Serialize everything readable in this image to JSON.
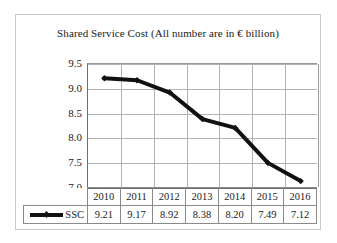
{
  "chart_data": {
    "type": "line",
    "title": "Shared Service Cost (All number are in € billion)",
    "xlabel": "",
    "ylabel": "",
    "categories": [
      "2010",
      "2011",
      "2012",
      "2013",
      "2014",
      "2015",
      "2016"
    ],
    "series": [
      {
        "name": "SSC",
        "values": [
          9.21,
          9.17,
          8.92,
          8.38,
          8.2,
          7.49,
          7.12
        ],
        "value_labels": [
          "9.21",
          "9.17",
          "8.92",
          "8.38",
          "8.20",
          "7.49",
          "7.12"
        ],
        "color": "#111111",
        "marker": "diamond"
      }
    ],
    "ylim": [
      7.0,
      9.5
    ],
    "yticks": [
      9.5,
      9.0,
      8.5,
      8.0,
      7.5,
      7.0
    ],
    "ytick_labels": [
      "9.5",
      "9.0",
      "8.5",
      "8.0",
      "7.5",
      "7.0"
    ],
    "grid": true,
    "grid_color": "#b3b3b3",
    "legend_position": "data-table-left"
  },
  "legend": {
    "series_label": "SSC",
    "marker_icon": "line-diamond-marker-icon"
  },
  "table": {
    "year_header": [
      "2010",
      "2011",
      "2012",
      "2013",
      "2014",
      "2015",
      "2016"
    ],
    "value_row": [
      "9.21",
      "9.17",
      "8.92",
      "8.38",
      "8.20",
      "7.49",
      "7.12"
    ]
  },
  "colors": {
    "series": "#111111",
    "grid": "#b3b3b3",
    "axis": "#6f6f6f",
    "frame": "#c9c9c9",
    "text": "#1a1a1a",
    "background": "#ffffff"
  }
}
